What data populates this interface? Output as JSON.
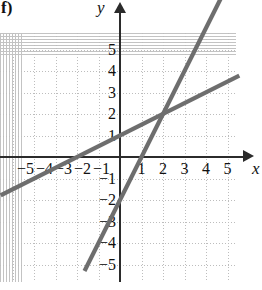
{
  "figure": {
    "part_label": "f)",
    "x_axis_name": "x",
    "y_axis_name": "y"
  },
  "chart_data": {
    "type": "line",
    "title": "",
    "xlabel": "x",
    "ylabel": "y",
    "xlim": [
      -5.55,
      5.75
    ],
    "ylim": [
      -5.75,
      5.8
    ],
    "grid": true,
    "grid_step": 1,
    "legend": "none",
    "x_tick_labels": [
      "−5",
      "−4",
      "−3",
      "−2",
      "−1",
      "1",
      "2",
      "3",
      "4",
      "5"
    ],
    "x_tick_values": [
      -5,
      -4,
      -3,
      -2,
      -1,
      1,
      2,
      3,
      4,
      5
    ],
    "y_tick_labels": [
      "5",
      "4",
      "3",
      "2",
      "1",
      "−1",
      "−2",
      "−3",
      "−4",
      "−5"
    ],
    "y_tick_values": [
      5,
      4,
      3,
      2,
      1,
      -1,
      -2,
      -3,
      -4,
      -5
    ],
    "line_color": "#6e6e6e",
    "axis_color": "#2b2b2b",
    "grid_color": "#bdbdbd",
    "series": [
      {
        "name": "shallow-line",
        "slope": 0.5,
        "y_intercept": 1,
        "x_intercept": -2,
        "points": [
          [
            -5.55,
            -1.78
          ],
          [
            5.55,
            3.78
          ]
        ]
      },
      {
        "name": "steep-line",
        "slope": 2,
        "y_intercept": -2,
        "x_intercept": 1,
        "points": [
          [
            -1.65,
            -5.3
          ],
          [
            5.1,
            8.2
          ]
        ]
      }
    ],
    "intersection": [
      2,
      2
    ]
  }
}
